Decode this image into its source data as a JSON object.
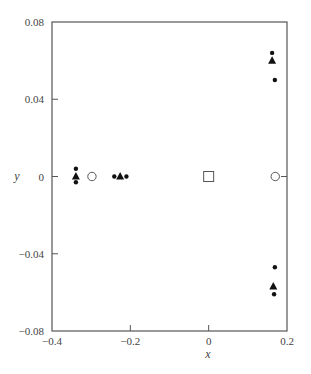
{
  "chart_data": {
    "type": "scatter",
    "title": "",
    "xlabel": "x",
    "ylabel": "y",
    "xlim": [
      -0.4,
      0.2
    ],
    "ylim": [
      -0.08,
      0.08
    ],
    "xticks": [
      -0.4,
      -0.2,
      0,
      0.2
    ],
    "xtick_labels": [
      "−0.4",
      "−0.2",
      "0",
      "0.2"
    ],
    "yticks": [
      0.08,
      0.04,
      0,
      -0.04,
      -0.08
    ],
    "ytick_labels": [
      "0.08",
      "0.04",
      "0",
      "−0.04",
      "−0.08"
    ],
    "grid": false,
    "legend": null,
    "series": [
      {
        "name": "filled-circle",
        "marker": "dot",
        "points": [
          [
            -0.339,
            0.004
          ],
          [
            -0.339,
            -0.003
          ],
          [
            -0.241,
            0.0
          ],
          [
            -0.21,
            0.0
          ],
          [
            0.162,
            0.064
          ],
          [
            0.169,
            0.05
          ],
          [
            0.169,
            -0.047
          ],
          [
            0.167,
            -0.061
          ]
        ]
      },
      {
        "name": "filled-triangle",
        "marker": "triangle",
        "points": [
          [
            -0.339,
            0.0
          ],
          [
            -0.226,
            0.0
          ],
          [
            0.162,
            0.06
          ],
          [
            0.165,
            -0.057
          ]
        ]
      },
      {
        "name": "open-circle",
        "marker": "circle-open",
        "points": [
          [
            -0.298,
            0.0
          ],
          [
            0.17,
            0.0
          ]
        ]
      },
      {
        "name": "open-square",
        "marker": "square-open",
        "points": [
          [
            0.0,
            0.0
          ]
        ]
      }
    ]
  }
}
